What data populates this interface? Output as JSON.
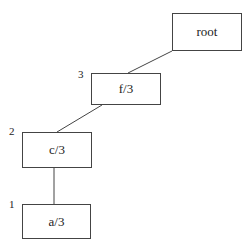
{
  "diagram": {
    "type": "tree",
    "nodes": [
      {
        "id": "root",
        "label": "root",
        "level": "",
        "x": 172,
        "y": 13,
        "w": 70,
        "h": 38
      },
      {
        "id": "f",
        "label": "f/3",
        "level": "3",
        "x": 91,
        "y": 73,
        "w": 70,
        "h": 32
      },
      {
        "id": "c",
        "label": "c/3",
        "level": "2",
        "x": 22,
        "y": 132,
        "w": 70,
        "h": 36
      },
      {
        "id": "a",
        "label": "a/3",
        "level": "1",
        "x": 22,
        "y": 204,
        "w": 69,
        "h": 35
      }
    ],
    "edges": [
      {
        "from": "root",
        "to": "f"
      },
      {
        "from": "f",
        "to": "c"
      },
      {
        "from": "c",
        "to": "a"
      }
    ],
    "colors": {
      "stroke": "#444444",
      "text": "#222222",
      "background": "#ffffff"
    }
  }
}
